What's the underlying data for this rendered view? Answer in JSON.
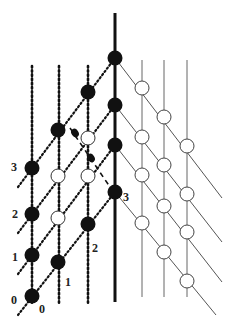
{
  "colors": {
    "ink": "#111111",
    "thin": "#555555",
    "open_fill": "#ffffff"
  },
  "labels": {
    "left_rows": [
      "0",
      "1",
      "2",
      "3"
    ],
    "bottom_cols": [
      "0",
      "1",
      "2"
    ],
    "thick_line": "3"
  },
  "nodes": {
    "filled": [
      [
        115,
        58
      ],
      [
        115,
        105
      ],
      [
        115,
        145
      ],
      [
        115,
        192
      ],
      [
        88,
        92
      ],
      [
        58,
        130
      ],
      [
        32,
        168
      ],
      [
        32,
        214
      ],
      [
        32,
        255
      ],
      [
        32,
        296
      ],
      [
        58,
        262
      ],
      [
        88,
        224
      ]
    ],
    "open_left": [
      [
        88,
        138
      ],
      [
        58,
        176
      ],
      [
        88,
        176
      ],
      [
        58,
        218
      ]
    ],
    "small_filled": [
      [
        75,
        133
      ],
      [
        91,
        158
      ]
    ],
    "open_right": [
      [
        142,
        88
      ],
      [
        164,
        117
      ],
      [
        187,
        146
      ],
      [
        142,
        137
      ],
      [
        164,
        165
      ],
      [
        187,
        194
      ],
      [
        142,
        175
      ],
      [
        164,
        206
      ],
      [
        187,
        232
      ],
      [
        142,
        223
      ],
      [
        164,
        252
      ],
      [
        187,
        281
      ]
    ]
  }
}
